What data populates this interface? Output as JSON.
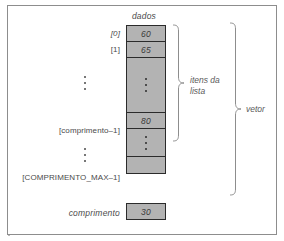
{
  "diagram": {
    "column_header": "dados",
    "array": {
      "cells": [
        {
          "index_label": "[0]",
          "value": "60",
          "kind": "value"
        },
        {
          "index_label": "[1]",
          "value": "65",
          "kind": "value"
        },
        {
          "index_label": "⋮",
          "value": "⋮",
          "kind": "ellipsis"
        },
        {
          "index_label": "[comprimento–1]",
          "value": "80",
          "kind": "value"
        },
        {
          "index_label": "⋮",
          "value": "⋮",
          "kind": "ellipsis"
        },
        {
          "index_label": "[COMPRIMENTO_MAX–1]",
          "value": "",
          "kind": "empty"
        }
      ]
    },
    "braces": [
      {
        "name": "itens-da-lista",
        "label_line1": "itens da",
        "label_line2": "lista"
      },
      {
        "name": "vetor",
        "label_line1": "vetor",
        "label_line2": ""
      }
    ],
    "length_field": {
      "label": "comprimento",
      "value": "30"
    },
    "colors": {
      "cell_fill": "#b3b3b3",
      "cell_border": "#2b2b2b",
      "frame_border": "#8d8d8d",
      "text": "#4a4a4a",
      "brace": "#8d8d8d"
    }
  }
}
